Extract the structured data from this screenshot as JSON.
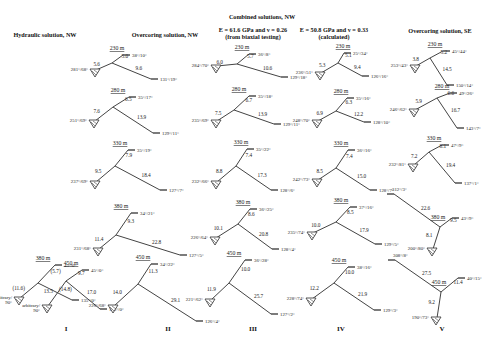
{
  "headers": {
    "combined": "Combined solutions, NW",
    "col1": "Hydraulic solution, NW",
    "col2": "Overcoring solution, NW",
    "col3_line1": "E = 61.6 GPa and v = 0.26",
    "col3_line2": "(from biaxial testing)",
    "col4_line1": "E = 50.8 GPa and v = 0.33",
    "col4_line2": "(calculated)",
    "col5": "Overcoring solution, SE"
  },
  "column_labels": [
    "I",
    "II",
    "III",
    "IV",
    "V"
  ],
  "colors": {
    "line": "#444444",
    "text": "#222222"
  },
  "diagrams": [
    {
      "col": "I",
      "depth": "380 m",
      "cx": 38,
      "cy": 283,
      "a": "(11.6)",
      "b": "(5.7)",
      "c": "(14.8)",
      "sa": "arbitrary/\n90°",
      "sb": "45°/0°",
      "sc": "135°/0°",
      "A": [
        20,
        298
      ],
      "B": [
        55,
        265
      ],
      "C": [
        72,
        300
      ],
      "fa": "left",
      "fb": "right",
      "fc": "right"
    },
    {
      "col": "I",
      "depth": "450 m",
      "cx": 66,
      "cy": 281,
      "a": "13.5",
      "b": "9.7",
      "c": "17.0",
      "sa": "arbitrary/\n90°",
      "sb": "45°/0°",
      "sc": "135°/0°",
      "A": [
        48,
        306
      ],
      "B": [
        82,
        270
      ],
      "C": [
        100,
        309
      ],
      "fa": "left",
      "fb": "right",
      "fc": "right"
    },
    {
      "col": "II",
      "depth": "230 m",
      "cx": 112,
      "cy": 63,
      "a": "5.6",
      "b": "5.0",
      "c": "9.6",
      "sa": "281°/68°",
      "sb": "38°/10°",
      "sc": "131°/19°",
      "A": [
        96,
        70
      ],
      "B": [
        123,
        55
      ],
      "C": [
        151,
        79
      ],
      "fa": "left",
      "fb": "right",
      "fc": "right"
    },
    {
      "col": "II",
      "depth": "280 m",
      "cx": 113,
      "cy": 107,
      "a": "7.6",
      "b": "6.5",
      "c": "13.9",
      "sa": "251°/69°",
      "sb": "35°/17°",
      "sc": "129°/11°",
      "A": [
        95,
        121
      ],
      "B": [
        129,
        97
      ],
      "C": [
        153,
        133
      ],
      "fa": "left",
      "fb": "right",
      "fc": "right"
    },
    {
      "col": "II",
      "depth": "330 m",
      "cx": 115,
      "cy": 166,
      "a": "9.5",
      "b": "7.9",
      "c": "18.4",
      "sa": "237°/69°",
      "sb": "35°/19°",
      "sc": "127°/7°",
      "A": [
        96,
        182
      ],
      "B": [
        128,
        150
      ],
      "C": [
        160,
        190
      ],
      "fa": "left",
      "fb": "right",
      "fc": "right"
    },
    {
      "col": "II",
      "depth": "380 m",
      "cx": 116,
      "cy": 235,
      "a": "11.4",
      "b": "9.3",
      "c": "22.8",
      "sa": "231°/68°",
      "sb": "34°/21°",
      "sc": "127°/5°",
      "A": [
        99,
        249
      ],
      "B": [
        131,
        213
      ],
      "C": [
        180,
        255
      ],
      "fa": "left",
      "fb": "right",
      "fc": "right"
    },
    {
      "col": "II",
      "depth": "450 m",
      "cx": 138,
      "cy": 284,
      "a": "14.0",
      "b": "11.3",
      "c": "29.1",
      "sa": "226°/68°",
      "sb": "34°/22°",
      "sc": "126°/4°",
      "A": [
        114,
        306
      ],
      "B": [
        151,
        264
      ],
      "C": [
        196,
        321
      ],
      "fa": "left",
      "fb": "right",
      "fc": "right"
    },
    {
      "col": "III",
      "depth": "230 m",
      "cx": 237,
      "cy": 64,
      "a": "6.0",
      "b": "5.7",
      "c": "10.6",
      "sa": "284°/70°",
      "sb": "36°/8°",
      "sc": "129°/18°",
      "A": [
        217,
        66
      ],
      "B": [
        249,
        54
      ],
      "C": [
        281,
        77
      ],
      "fa": "left",
      "fb": "right",
      "fc": "right"
    },
    {
      "col": "III",
      "depth": "280 m",
      "cx": 234,
      "cy": 110,
      "a": "7.5",
      "b": "6.7",
      "c": "13.9",
      "sa": "235°/69°",
      "sb": "35°/18°",
      "sc": "129°/11°",
      "A": [
        217,
        121
      ],
      "B": [
        249,
        96
      ],
      "C": [
        274,
        124
      ],
      "fa": "right",
      "fb": "right",
      "fc": "right"
    },
    {
      "col": "III",
      "depth": "330 m",
      "cx": 236,
      "cy": 166,
      "a": "8.8",
      "b": "7.4",
      "c": "17.3",
      "sa": "232°/66°",
      "sb": "35°/22°",
      "sc": "128°/6°",
      "A": [
        217,
        182
      ],
      "B": [
        247,
        149
      ],
      "C": [
        271,
        190
      ],
      "fa": "right",
      "fb": "right",
      "fc": "right"
    },
    {
      "col": "III",
      "depth": "380 m",
      "cx": 238,
      "cy": 224,
      "a": "10.1",
      "b": "8.6",
      "c": "20.8",
      "sa": "226°/64°",
      "sb": "36°/25°",
      "sc": "128°/4°",
      "A": [
        216,
        238
      ],
      "B": [
        250,
        209
      ],
      "C": [
        272,
        249
      ],
      "fa": "right",
      "fb": "right",
      "fc": "right"
    },
    {
      "col": "III",
      "depth": "450 m",
      "cx": 229,
      "cy": 283,
      "a": "11.9",
      "b": "10.0",
      "c": "25.7",
      "sa": "221°/62°",
      "sb": "36°/28°",
      "sc": "127°/2°",
      "A": [
        211,
        300
      ],
      "B": [
        245,
        260
      ],
      "C": [
        271,
        314
      ],
      "fa": "right",
      "fb": "right",
      "fc": "right"
    },
    {
      "col": "IV",
      "depth": "230 m",
      "cx": 338,
      "cy": 63,
      "a": "5.3",
      "b": "5.1",
      "c": "9.4",
      "sa": "236°/51°",
      "sb": "25°/34°",
      "sc": "126°/16°",
      "A": [
        321,
        73
      ],
      "B": [
        344,
        53
      ],
      "C": [
        362,
        76
      ],
      "fa": "left",
      "fb": "right",
      "fc": "right"
    },
    {
      "col": "IV",
      "depth": "280 m",
      "cx": 336,
      "cy": 111,
      "a": "6.9",
      "b": "6.3",
      "c": "12.2",
      "sa": "248°/70°",
      "sb": "35°/16°",
      "sc": "128°/10°",
      "A": [
        318,
        121
      ],
      "B": [
        347,
        98
      ],
      "C": [
        364,
        122
      ],
      "fa": "left",
      "fb": "right",
      "fc": "right"
    },
    {
      "col": "IV",
      "depth": "330 m",
      "cx": 336,
      "cy": 168,
      "a": "8.5",
      "b": "7.4",
      "c": "15.0",
      "sa": "242°/73°",
      "sb": "36°/16°",
      "sc": "128°/7°",
      "A": [
        318,
        180
      ],
      "B": [
        348,
        150
      ],
      "C": [
        370,
        190
      ],
      "fa": "left",
      "fb": "right",
      "fc": "right"
    },
    {
      "col": "IV",
      "depth": "380 m",
      "cx": 336,
      "cy": 222,
      "a": "10.0",
      "b": "8.5",
      "c": "17.9",
      "sa": "235°/74°",
      "sb": "37°/16°",
      "sc": "129°/5°",
      "A": [
        313,
        233
      ],
      "B": [
        350,
        207
      ],
      "C": [
        375,
        244
      ],
      "fa": "left",
      "fb": "right",
      "fc": "right"
    },
    {
      "col": "IV",
      "depth": "450 m",
      "cx": 334,
      "cy": 283,
      "a": "12.2",
      "b": "10.0",
      "c": "21.9",
      "sa": "228°/74°",
      "sb": "38°/16°",
      "sc": "129°/3°",
      "A": [
        312,
        299
      ],
      "B": [
        348,
        267
      ],
      "C": [
        374,
        310
      ],
      "fa": "left",
      "fb": "right",
      "fc": "right"
    },
    {
      "col": "V",
      "depth": "230 m",
      "cx": 430,
      "cy": 58,
      "a": "3.8",
      "b": "5.2",
      "c": "14.5",
      "sa": "253°/43°",
      "sb": "45°/44°",
      "sc": "150°/14°",
      "A": [
        416,
        66
      ],
      "B": [
        443,
        51
      ],
      "C": [
        447,
        85
      ],
      "fa": "left",
      "fb": "right",
      "fc": "right"
    },
    {
      "col": "V",
      "depth": "280 m",
      "cx": 437,
      "cy": 98,
      "a": "5.9",
      "b": "6.6",
      "c": "16.7",
      "sa": "246°/62°",
      "sb": "49°/26°",
      "sc": "143°/7°",
      "A": [
        415,
        110
      ],
      "B": [
        450,
        93
      ],
      "C": [
        457,
        128
      ],
      "fa": "left",
      "fb": "right",
      "fc": "right"
    },
    {
      "col": "V",
      "depth": "330 m",
      "cx": 429,
      "cy": 152,
      "a": "7.2",
      "b": "8.1",
      "c": "19.4",
      "sa": "232°/81°",
      "sb": "47°/9°",
      "sc": "137°/1°",
      "A": [
        414,
        165
      ],
      "B": [
        442,
        145
      ],
      "C": [
        455,
        183
      ],
      "fa": "left",
      "fb": "right",
      "fc": "right"
    },
    {
      "col": "V",
      "depth": "380 m",
      "cx": 440,
      "cy": 227,
      "a": "8.1",
      "b": "9.5",
      "c": "22.6",
      "sa": "200°/80°",
      "sb": "43°/9°",
      "sc": "312°/3°",
      "A": [
        433,
        249
      ],
      "B": [
        452,
        218
      ],
      "C": [
        394,
        194
      ],
      "fa": "left",
      "fb": "right",
      "fc": "left"
    },
    {
      "col": "V",
      "depth": "450 m",
      "cx": 441,
      "cy": 292,
      "a": "9.2",
      "b": "11.4",
      "c": "27.5",
      "sa": "190°/73°",
      "sb": "40°/15°",
      "sc": "308°/8°",
      "A": [
        437,
        318
      ],
      "B": [
        458,
        278
      ],
      "C": [
        395,
        260
      ],
      "fa": "left",
      "fb": "right",
      "fc": "left"
    }
  ]
}
